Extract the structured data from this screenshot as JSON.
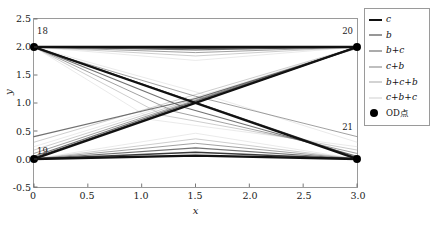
{
  "chart_data": {
    "type": "line",
    "title": "",
    "xlabel": "x",
    "ylabel": "y",
    "xlim": [
      0,
      3.0
    ],
    "ylim": [
      -0.5,
      2.5
    ],
    "xticks": [
      "0",
      "0.5",
      "1.0",
      "1.5",
      "2.0",
      "2.5",
      "3.0"
    ],
    "xtick_values": [
      0,
      0.5,
      1.0,
      1.5,
      2.0,
      2.5,
      3.0
    ],
    "yticks": [
      "-0.5",
      "0.0",
      "0.5",
      "1.0",
      "1.5",
      "2.0",
      "2.5"
    ],
    "ytick_values": [
      -0.5,
      0.0,
      0.5,
      1.0,
      1.5,
      2.0,
      2.5
    ],
    "grid": false,
    "legend_position": "right-outside",
    "nodes": [
      {
        "id": "18",
        "x": 0.0,
        "y": 2.0
      },
      {
        "id": "20",
        "x": 3.0,
        "y": 2.0
      },
      {
        "id": "19",
        "x": 0.0,
        "y": 0.0
      },
      {
        "id": "21",
        "x": 3.0,
        "y": 0.0
      }
    ],
    "series": [
      {
        "name": "c",
        "color": "#111111",
        "width": 2.4,
        "alpha": 1.0
      },
      {
        "name": "b",
        "color": "#303030",
        "width": 1.6,
        "alpha": 0.95
      },
      {
        "name": "b+c",
        "color": "#585858",
        "width": 1.2,
        "alpha": 0.85
      },
      {
        "name": "c+b",
        "color": "#808080",
        "width": 1.0,
        "alpha": 0.75
      },
      {
        "name": "b+c+b",
        "color": "#a8a8a8",
        "width": 0.9,
        "alpha": 0.65
      },
      {
        "name": "c+b+c",
        "color": "#cfcfcf",
        "width": 0.8,
        "alpha": 0.55
      }
    ],
    "marker_series": {
      "name": "OD点",
      "marker": "o",
      "color": "#000000",
      "size": 8
    },
    "paths": [
      {
        "series": "c",
        "points": [
          [
            0.0,
            2.0
          ],
          [
            1.5,
            2.0
          ],
          [
            3.0,
            2.0
          ]
        ]
      },
      {
        "series": "c",
        "points": [
          [
            0.0,
            0.0
          ],
          [
            1.5,
            0.06
          ],
          [
            3.0,
            0.0
          ]
        ]
      },
      {
        "series": "c",
        "points": [
          [
            0.0,
            2.0
          ],
          [
            3.0,
            0.0
          ]
        ]
      },
      {
        "series": "c",
        "points": [
          [
            0.0,
            0.0
          ],
          [
            3.0,
            2.0
          ]
        ]
      },
      {
        "series": "b",
        "points": [
          [
            0.0,
            2.0
          ],
          [
            1.5,
            1.98
          ],
          [
            3.0,
            2.0
          ]
        ]
      },
      {
        "series": "b",
        "points": [
          [
            0.0,
            0.0
          ],
          [
            1.5,
            0.12
          ],
          [
            3.0,
            0.0
          ]
        ]
      },
      {
        "series": "b",
        "points": [
          [
            0.0,
            2.0
          ],
          [
            3.0,
            0.02
          ]
        ]
      },
      {
        "series": "b",
        "points": [
          [
            0.0,
            0.02
          ],
          [
            3.0,
            2.0
          ]
        ]
      },
      {
        "series": "b+c",
        "points": [
          [
            0.0,
            2.0
          ],
          [
            1.5,
            1.95
          ],
          [
            3.0,
            2.0
          ]
        ]
      },
      {
        "series": "b+c",
        "points": [
          [
            0.0,
            0.0
          ],
          [
            1.5,
            0.2
          ],
          [
            3.0,
            0.0
          ]
        ]
      },
      {
        "series": "b+c",
        "points": [
          [
            0.0,
            2.0
          ],
          [
            1.4,
            0.92
          ],
          [
            3.0,
            0.05
          ]
        ]
      },
      {
        "series": "b+c",
        "points": [
          [
            0.0,
            0.05
          ],
          [
            1.6,
            1.1
          ],
          [
            3.0,
            2.0
          ]
        ]
      },
      {
        "series": "c+b",
        "points": [
          [
            0.0,
            2.0
          ],
          [
            1.5,
            1.9
          ],
          [
            3.0,
            2.0
          ]
        ]
      },
      {
        "series": "c+b",
        "points": [
          [
            0.0,
            0.0
          ],
          [
            1.5,
            0.28
          ],
          [
            3.0,
            0.0
          ]
        ]
      },
      {
        "series": "c+b",
        "points": [
          [
            0.0,
            2.0
          ],
          [
            1.3,
            0.85
          ],
          [
            3.0,
            0.1
          ]
        ]
      },
      {
        "series": "c+b",
        "points": [
          [
            0.0,
            0.1
          ],
          [
            1.7,
            1.18
          ],
          [
            3.0,
            2.0
          ]
        ]
      },
      {
        "series": "b+c+b",
        "points": [
          [
            0.0,
            2.0
          ],
          [
            1.5,
            1.84
          ],
          [
            3.0,
            2.0
          ]
        ]
      },
      {
        "series": "b+c+b",
        "points": [
          [
            0.0,
            0.0
          ],
          [
            1.5,
            0.36
          ],
          [
            3.0,
            0.0
          ]
        ]
      },
      {
        "series": "b+c+b",
        "points": [
          [
            0.0,
            2.0
          ],
          [
            1.2,
            0.78
          ],
          [
            3.0,
            0.16
          ]
        ]
      },
      {
        "series": "b+c+b",
        "points": [
          [
            0.0,
            0.16
          ],
          [
            1.8,
            1.26
          ],
          [
            3.0,
            2.0
          ]
        ]
      },
      {
        "series": "c+b+c",
        "points": [
          [
            0.0,
            2.0
          ],
          [
            1.5,
            1.76
          ],
          [
            3.0,
            2.0
          ]
        ]
      },
      {
        "series": "c+b+c",
        "points": [
          [
            0.0,
            0.0
          ],
          [
            1.5,
            0.46
          ],
          [
            3.0,
            0.0
          ]
        ]
      },
      {
        "series": "c+b+c",
        "points": [
          [
            0.0,
            2.0
          ],
          [
            1.1,
            0.7
          ],
          [
            3.0,
            0.22
          ]
        ]
      },
      {
        "series": "c+b+c",
        "points": [
          [
            0.0,
            0.22
          ],
          [
            1.9,
            1.34
          ],
          [
            3.0,
            2.0
          ]
        ]
      },
      {
        "series": "c+b+c",
        "points": [
          [
            0.0,
            2.0
          ],
          [
            1.5,
            1.2
          ],
          [
            3.0,
            0.3
          ]
        ]
      },
      {
        "series": "b+c+b",
        "points": [
          [
            0.0,
            0.3
          ],
          [
            1.5,
            1.15
          ],
          [
            3.0,
            2.0
          ]
        ]
      },
      {
        "series": "c+b",
        "points": [
          [
            0.0,
            1.98
          ],
          [
            1.5,
            1.12
          ],
          [
            3.0,
            0.4
          ]
        ]
      },
      {
        "series": "b+c",
        "points": [
          [
            0.0,
            0.4
          ],
          [
            1.5,
            1.08
          ],
          [
            3.0,
            1.98
          ]
        ]
      }
    ]
  },
  "legend": {
    "entries": [
      {
        "label": "c"
      },
      {
        "label": "b"
      },
      {
        "label": "b+c"
      },
      {
        "label": "c+b"
      },
      {
        "label": "b+c+b"
      },
      {
        "label": "c+b+c"
      },
      {
        "label": "OD点"
      }
    ]
  }
}
